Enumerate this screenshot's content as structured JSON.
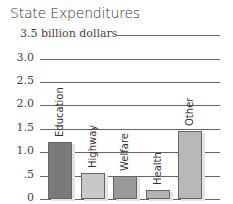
{
  "chart_data": {
    "type": "bar",
    "title": "State Expenditures",
    "ylabel": "billion dollars",
    "xlabel": "",
    "categories": [
      "Education",
      "Highway",
      "Welfare",
      "Health",
      "Other"
    ],
    "values": [
      1.22,
      0.56,
      0.5,
      0.2,
      1.45
    ],
    "ylim": [
      0,
      3.5
    ],
    "yticks": [
      "0",
      ".5",
      "1.0",
      "1.5",
      "2.0",
      "2.5",
      "3.0",
      "3.5"
    ],
    "grid": true,
    "legend": "none",
    "bar_colors": [
      "#7a7a7a",
      "#c8c8c8",
      "#9a9a9a",
      "#b4b4b4",
      "#b8b8b8"
    ]
  },
  "labels": {
    "title": "State Expenditures",
    "top_tick": "3.5 billion dollars",
    "ticks": [
      "3.0",
      "2.5",
      "2.0",
      "1.5",
      "1.0",
      ".5",
      "0"
    ],
    "bars": [
      "Education",
      "Highway",
      "Welfare",
      "Health",
      "Other"
    ]
  }
}
